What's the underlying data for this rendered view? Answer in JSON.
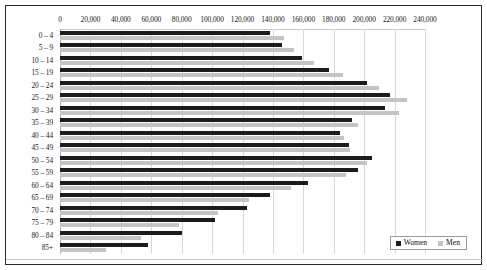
{
  "chart_data": {
    "type": "bar",
    "orientation": "horizontal",
    "title": "",
    "subtitle": "",
    "xlabel": "",
    "ylabel": "",
    "xlim": [
      0,
      240000
    ],
    "ylim": null,
    "grid": true,
    "legend_position": "bottom-right",
    "categories": [
      "0 – 4",
      "5 – 9",
      "10 – 14",
      "15 – 19",
      "20 – 24",
      "25 – 29",
      "30 – 34",
      "35 – 39",
      "40 – 44",
      "45 – 49",
      "50 – 54",
      "55 – 59",
      "60 – 64",
      "65 – 69",
      "70 – 74",
      "75 – 79",
      "80 – 84",
      "85+"
    ],
    "series": [
      {
        "name": "Women",
        "color": "#1c1c1c",
        "values": [
          138000,
          146000,
          159000,
          177000,
          202000,
          217000,
          214000,
          192000,
          184000,
          190000,
          205000,
          196000,
          163000,
          138000,
          123000,
          102000,
          80000,
          58000
        ]
      },
      {
        "name": "Men",
        "color": "#c4c4c4",
        "values": [
          147000,
          154000,
          167000,
          186000,
          210000,
          228000,
          223000,
          196000,
          187000,
          191000,
          202000,
          188000,
          152000,
          124000,
          104000,
          78000,
          53000,
          30000
        ]
      }
    ],
    "xticks": [
      0,
      20000,
      40000,
      60000,
      80000,
      100000,
      120000,
      140000,
      160000,
      180000,
      200000,
      220000,
      240000
    ],
    "xtick_labels": [
      "0",
      "20,000",
      "40,000",
      "60,000",
      "80,000",
      "100,000",
      "120,000",
      "140,000",
      "160,000",
      "180,000",
      "200,000",
      "220,000",
      "240,000"
    ]
  },
  "legend": {
    "items": [
      {
        "label": "Women",
        "color": "#1c1c1c"
      },
      {
        "label": "Men",
        "color": "#c4c4c4"
      }
    ]
  },
  "colors": {
    "women": "#1c1c1c",
    "men": "#c4c4c4",
    "grid": "#d8d8d8",
    "border": "#2a2a2a",
    "background": "#ffffff",
    "text": "#1a1a1a"
  }
}
